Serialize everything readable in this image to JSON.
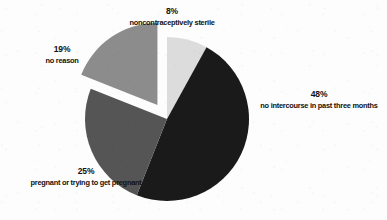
{
  "chart_data": {
    "type": "pie",
    "title": "",
    "subtitle": "",
    "xlabel": "",
    "ylabel": "",
    "legend_position": "labels-outside",
    "grid": false,
    "units": "percent",
    "categories": [
      "noncontraceptively sterile",
      "no intercourse in past three months",
      "pregnant or trying to get pregnant",
      "no reason"
    ],
    "values": [
      8,
      48,
      25,
      19
    ],
    "slices": [
      {
        "id": "sterile",
        "label": "noncontraceptively sterile",
        "percent_text": "8%",
        "value": 8,
        "color": "#dcdcdc",
        "exploded": false,
        "start_angle": 0,
        "end_angle": 28.8
      },
      {
        "id": "no-intercourse",
        "label": "no intercourse in past three months",
        "percent_text": "48%",
        "value": 48,
        "color": "#1a1a1a",
        "exploded": false,
        "start_angle": 28.8,
        "end_angle": 201.6
      },
      {
        "id": "pregnant",
        "label": "pregnant or trying to get pregnant",
        "percent_text": "25%",
        "value": 25,
        "color": "#555555",
        "exploded": false,
        "start_angle": 201.6,
        "end_angle": 291.6
      },
      {
        "id": "no-reason",
        "label": "no reason",
        "percent_text": "19%",
        "value": 19,
        "color": "#8c8c8c",
        "exploded": true,
        "start_angle": 291.6,
        "end_angle": 360
      }
    ]
  },
  "labels": {
    "sterile": {
      "percent": "8%",
      "text": "noncontraceptively sterile"
    },
    "no_intercourse": {
      "percent": "48%",
      "text": "no intercourse in past three months"
    },
    "pregnant": {
      "percent": "25%",
      "text": "pregnant or trying to get pregnant"
    },
    "no_reason": {
      "percent": "19%",
      "text": "no reason"
    }
  },
  "colors": {
    "background": "#fdfdfd",
    "slice_sterile": "#dcdcdc",
    "slice_no_intercourse": "#1a1a1a",
    "slice_pregnant": "#555555",
    "slice_no_reason": "#8c8c8c",
    "text": "#111111"
  }
}
